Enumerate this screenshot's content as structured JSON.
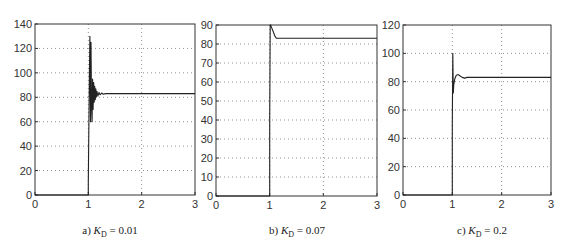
{
  "figure": {
    "panels": [
      {
        "id": "a",
        "caption_prefix": "a) ",
        "caption_var": "K",
        "caption_sub": "D",
        "caption_value": " = 0.01",
        "box": {
          "left": 35,
          "top": 24,
          "right": 195,
          "bottom": 195
        },
        "caption_x": 110
      },
      {
        "id": "b",
        "caption_prefix": "b) ",
        "caption_var": "K",
        "caption_sub": "D",
        "caption_value": " = 0.07",
        "box": {
          "left": 216,
          "top": 25,
          "right": 377,
          "bottom": 196
        },
        "caption_x": 297
      },
      {
        "id": "c",
        "caption_prefix": "c) ",
        "caption_var": "K",
        "caption_sub": "D",
        "caption_value": " = 0.2",
        "box": {
          "left": 403,
          "top": 25,
          "right": 551,
          "bottom": 195
        },
        "caption_x": 482
      }
    ]
  },
  "chart_data": [
    {
      "type": "line",
      "title": "a) K_D = 0.01",
      "xlabel": "",
      "ylabel": "",
      "xlim": [
        0,
        3
      ],
      "ylim": [
        0,
        140
      ],
      "xticks": [
        0,
        1,
        2,
        3
      ],
      "yticks": [
        0,
        20,
        40,
        60,
        80,
        100,
        120,
        140
      ],
      "grid": true,
      "legend": null,
      "series": [
        {
          "name": "response",
          "x": [
            0,
            1.0,
            1.0,
            1.02,
            1.03,
            1.04,
            1.05,
            1.06,
            1.07,
            1.08,
            1.09,
            1.1,
            1.11,
            1.12,
            1.13,
            1.14,
            1.15,
            1.16,
            1.18,
            1.2,
            1.22,
            1.25,
            1.28,
            1.32,
            3.0
          ],
          "y": [
            0,
            0,
            10,
            100,
            130,
            60,
            125,
            75,
            60,
            95,
            70,
            92,
            76,
            89,
            78,
            87,
            80,
            85,
            81,
            84,
            82,
            83.5,
            82.5,
            83,
            83
          ]
        }
      ]
    },
    {
      "type": "line",
      "title": "b) K_D = 0.07",
      "xlabel": "",
      "ylabel": "",
      "xlim": [
        0,
        3
      ],
      "ylim": [
        0,
        90
      ],
      "xticks": [
        0,
        1,
        2,
        3
      ],
      "yticks": [
        0,
        10,
        20,
        30,
        40,
        50,
        60,
        70,
        80,
        90
      ],
      "grid": true,
      "legend": null,
      "series": [
        {
          "name": "response",
          "x": [
            0,
            1.0,
            1.0,
            1.01,
            1.02,
            1.03,
            1.06,
            1.1,
            1.13,
            3.0
          ],
          "y": [
            0,
            0,
            40,
            90,
            90,
            89,
            87,
            84,
            83,
            83
          ]
        }
      ]
    },
    {
      "type": "line",
      "title": "c) K_D = 0.2",
      "xlabel": "",
      "ylabel": "",
      "xlim": [
        0,
        3
      ],
      "ylim": [
        0,
        120
      ],
      "xticks": [
        0,
        1,
        2,
        3
      ],
      "yticks": [
        0,
        20,
        40,
        60,
        80,
        100,
        120
      ],
      "grid": true,
      "legend": null,
      "series": [
        {
          "name": "response",
          "x": [
            0,
            1.0,
            1.0,
            1.01,
            1.02,
            1.03,
            1.05,
            1.08,
            1.12,
            1.16,
            1.2,
            1.25,
            1.3,
            1.35,
            3.0
          ],
          "y": [
            0,
            0,
            50,
            100,
            72,
            78,
            82,
            84.5,
            85,
            84,
            83,
            82.5,
            83,
            83,
            83
          ]
        }
      ]
    }
  ]
}
